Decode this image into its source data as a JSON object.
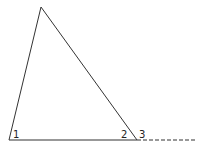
{
  "diagram": {
    "type": "triangle-exterior-angle",
    "vertices": {
      "apex": [
        41,
        7
      ],
      "base_left": [
        9,
        140
      ],
      "base_right": [
        137,
        140
      ]
    },
    "extension_end": [
      196,
      140
    ],
    "angle_labels": [
      {
        "label": "1",
        "position": [
          15,
          138
        ]
      },
      {
        "label": "2",
        "position": [
          122,
          138
        ]
      },
      {
        "label": "3",
        "position": [
          141,
          138
        ]
      }
    ],
    "stroke_color": "#333333"
  }
}
